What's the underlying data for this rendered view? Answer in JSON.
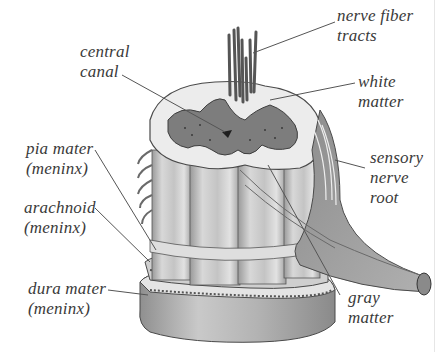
{
  "diagram": {
    "labels": {
      "nerve_fiber_tracts": {
        "line1": "nerve fiber",
        "line2": "tracts"
      },
      "central_canal": {
        "line1": "central",
        "line2": "canal"
      },
      "white_matter": {
        "line1": "white",
        "line2": "matter"
      },
      "pia_mater": {
        "line1": "pia mater",
        "line2": "(meninx)"
      },
      "sensory_nerve_root": {
        "line1": "sensory",
        "line2": "nerve",
        "line3": "root"
      },
      "arachnoid": {
        "line1": "arachnoid",
        "line2": "(meninx)"
      },
      "dura_mater": {
        "line1": "dura mater",
        "line2": "(meninx)"
      },
      "gray_matter": {
        "line1": "gray",
        "line2": "matter"
      }
    },
    "colors": {
      "background": "#ffffff",
      "label_text": "#3a3a3a",
      "leader_line": "#555555",
      "white_matter_fill": "#e9e9e9",
      "gray_matter_fill": "#7d7d7d",
      "tissue_shade": "#b5b5b5",
      "outline": "#4a4a4a"
    }
  }
}
